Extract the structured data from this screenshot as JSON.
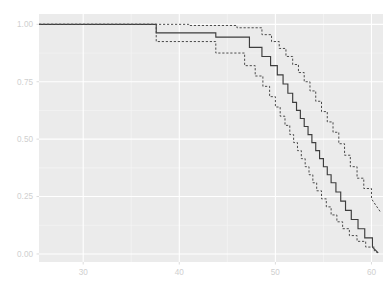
{
  "chart_data": {
    "type": "line",
    "title": "",
    "subtitle": "",
    "xlabel": "",
    "ylabel": "",
    "xlim": [
      25.4,
      61.2
    ],
    "ylim": [
      -0.035,
      1.045
    ],
    "xticks": [
      30,
      40,
      50,
      60
    ],
    "xtick_labels": [
      "30",
      "40",
      "50",
      "60"
    ],
    "yticks": [
      0.0,
      0.25,
      0.5,
      0.75,
      1.0
    ],
    "ytick_labels": [
      "0.00",
      "0.25",
      "0.50",
      "0.75",
      "1.00"
    ],
    "grid": true,
    "grid_major_color": "#ffffff",
    "grid_minor_color": "#f7f7f7",
    "panel_background": "#ebebeb",
    "legend": "none",
    "step_style": "post",
    "series": [
      {
        "name": "survival-estimate",
        "style": "solid",
        "color": "#3d3d3d",
        "width": 1.15,
        "x": [
          25.4,
          37.6,
          37.6,
          43.8,
          43.8,
          47.3,
          47.3,
          48.6,
          48.6,
          49.5,
          49.5,
          50.2,
          50.2,
          50.8,
          50.8,
          51.3,
          51.3,
          51.8,
          51.8,
          52.2,
          52.2,
          52.6,
          52.6,
          53.0,
          53.0,
          53.4,
          53.4,
          53.8,
          53.8,
          54.2,
          54.2,
          54.6,
          54.6,
          55.0,
          55.0,
          55.4,
          55.4,
          55.8,
          55.8,
          56.3,
          56.3,
          56.8,
          56.8,
          57.3,
          57.3,
          57.9,
          57.9,
          58.6,
          58.6,
          59.3,
          59.3,
          60.1,
          60.1,
          60.7
        ],
        "y": [
          1.0,
          1.0,
          0.963,
          0.963,
          0.944,
          0.944,
          0.9,
          0.9,
          0.86,
          0.86,
          0.82,
          0.82,
          0.78,
          0.78,
          0.74,
          0.74,
          0.7,
          0.7,
          0.66,
          0.66,
          0.625,
          0.625,
          0.59,
          0.59,
          0.555,
          0.555,
          0.52,
          0.52,
          0.485,
          0.485,
          0.45,
          0.45,
          0.415,
          0.415,
          0.38,
          0.38,
          0.345,
          0.345,
          0.31,
          0.31,
          0.27,
          0.27,
          0.23,
          0.23,
          0.19,
          0.19,
          0.15,
          0.15,
          0.11,
          0.11,
          0.07,
          0.07,
          0.03,
          0.005
        ]
      },
      {
        "name": "confidence-upper",
        "style": "dashed",
        "color": "#4a4a4a",
        "width": 1.0,
        "x": [
          25.4,
          41.0,
          41.0,
          46.0,
          46.0,
          48.6,
          48.6,
          49.6,
          49.6,
          50.4,
          50.4,
          51.1,
          51.1,
          51.8,
          51.8,
          52.4,
          52.4,
          53.0,
          53.0,
          53.6,
          53.6,
          54.2,
          54.2,
          54.8,
          54.8,
          55.4,
          55.4,
          56.0,
          56.0,
          56.6,
          56.6,
          57.2,
          57.2,
          57.8,
          57.8,
          58.5,
          58.5,
          59.2,
          59.2,
          60.0,
          60.0,
          60.9
        ],
        "y": [
          1.0,
          1.0,
          0.995,
          0.995,
          0.985,
          0.985,
          0.955,
          0.955,
          0.925,
          0.925,
          0.895,
          0.895,
          0.86,
          0.86,
          0.825,
          0.825,
          0.79,
          0.79,
          0.75,
          0.75,
          0.71,
          0.71,
          0.665,
          0.665,
          0.62,
          0.62,
          0.575,
          0.575,
          0.53,
          0.53,
          0.48,
          0.48,
          0.43,
          0.43,
          0.38,
          0.38,
          0.33,
          0.33,
          0.285,
          0.285,
          0.24,
          0.185
        ]
      },
      {
        "name": "confidence-lower",
        "style": "dashed",
        "color": "#4a4a4a",
        "width": 1.0,
        "x": [
          25.4,
          37.6,
          37.6,
          43.8,
          43.8,
          46.8,
          46.8,
          47.9,
          47.9,
          48.7,
          48.7,
          49.4,
          49.4,
          50.0,
          50.0,
          50.5,
          50.5,
          51.0,
          51.0,
          51.5,
          51.5,
          51.9,
          51.9,
          52.3,
          52.3,
          52.7,
          52.7,
          53.1,
          53.1,
          53.5,
          53.5,
          53.9,
          53.9,
          54.3,
          54.3,
          54.8,
          54.8,
          55.3,
          55.3,
          55.8,
          55.8,
          56.4,
          56.4,
          57.0,
          57.0,
          57.7,
          57.7,
          58.5,
          58.5,
          59.4,
          59.4,
          60.3,
          60.3,
          60.7
        ],
        "y": [
          1.0,
          1.0,
          0.925,
          0.925,
          0.875,
          0.875,
          0.82,
          0.82,
          0.775,
          0.775,
          0.73,
          0.73,
          0.685,
          0.685,
          0.64,
          0.64,
          0.6,
          0.6,
          0.56,
          0.56,
          0.52,
          0.52,
          0.485,
          0.485,
          0.45,
          0.45,
          0.415,
          0.415,
          0.38,
          0.38,
          0.345,
          0.345,
          0.31,
          0.31,
          0.275,
          0.275,
          0.24,
          0.24,
          0.205,
          0.205,
          0.17,
          0.17,
          0.14,
          0.14,
          0.11,
          0.11,
          0.08,
          0.08,
          0.055,
          0.055,
          0.03,
          0.03,
          0.012,
          0.005
        ]
      }
    ]
  },
  "panel": {
    "left": 39,
    "right": 383,
    "top": 14,
    "bottom": 262
  }
}
